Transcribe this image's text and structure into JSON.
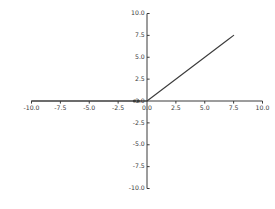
{
  "chart_data": {
    "type": "line",
    "title": "",
    "xlabel": "",
    "ylabel": "",
    "xlim": [
      -10.0,
      10.0
    ],
    "ylim": [
      -10.0,
      10.0
    ],
    "grid": false,
    "legend": false,
    "legend_position": "none",
    "spines": "centered-at-origin",
    "line_color": "#3c3c3c",
    "background_color": "#ffffff",
    "tick_color": "#3a3a3a",
    "xticks": [
      -10.0,
      -7.5,
      -5.0,
      -2.5,
      0.0,
      2.5,
      5.0,
      7.5,
      10.0
    ],
    "xtick_labels": [
      "-10.0",
      "-7.5",
      "-5.0",
      "-2.5",
      "0.0",
      "2.5",
      "5.0",
      "7.5",
      "10.0"
    ],
    "yticks": [
      -10.0,
      -7.5,
      -5.0,
      -2.5,
      0.0,
      2.5,
      5.0,
      7.5,
      10.0
    ],
    "ytick_labels": [
      "-10.0",
      "-7.5",
      "-5.0",
      "-2.5",
      "0.0",
      "2.5",
      "5.0",
      "7.5",
      "10.0"
    ],
    "series": [
      {
        "name": "relu",
        "x": [
          -10.0,
          -9.0,
          -8.0,
          -7.0,
          -6.0,
          -5.0,
          -4.0,
          -3.0,
          -2.0,
          -1.0,
          0.0,
          1.0,
          2.0,
          3.0,
          4.0,
          5.0,
          6.0,
          7.0,
          7.5
        ],
        "values": [
          0.0,
          0.0,
          0.0,
          0.0,
          0.0,
          0.0,
          0.0,
          0.0,
          0.0,
          0.0,
          0.0,
          1.0,
          2.0,
          3.0,
          4.0,
          5.0,
          6.0,
          7.0,
          7.5
        ]
      }
    ],
    "markers": [
      {
        "x": -1.1,
        "y": 0.0
      },
      {
        "x": -0.75,
        "y": 0.0
      }
    ]
  }
}
